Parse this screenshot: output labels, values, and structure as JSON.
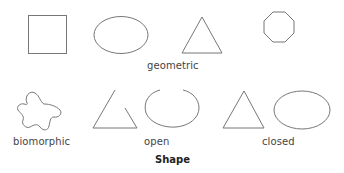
{
  "figure": {
    "title": "Shape",
    "stroke_color": "#777777",
    "groups": {
      "geometric": {
        "label": "geometric",
        "shapes": [
          "square",
          "ellipse",
          "triangle",
          "octagon"
        ]
      },
      "biomorphic": {
        "label": "biomorphic",
        "shapes": [
          "organic-blob"
        ]
      },
      "open": {
        "label": "open",
        "shapes": [
          "open-triangle",
          "open-ellipse"
        ]
      },
      "closed": {
        "label": "closed",
        "shapes": [
          "closed-triangle",
          "closed-ellipse"
        ]
      }
    }
  }
}
